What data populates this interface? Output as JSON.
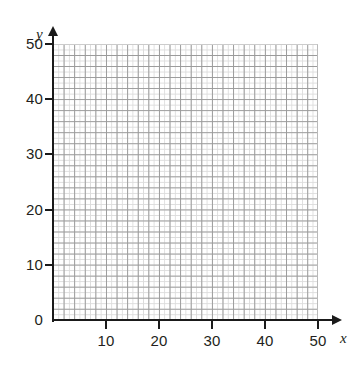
{
  "figure": {
    "kind": "blank-coordinate-grid",
    "background_color": "#ffffff"
  },
  "axes": {
    "x": {
      "name": "x",
      "min": 0,
      "max": 50,
      "labeled_ticks": [
        "10",
        "20",
        "30",
        "40",
        "50"
      ],
      "origin_label": "0",
      "arrow": true
    },
    "y": {
      "name": "y",
      "min": 0,
      "max": 50,
      "labeled_ticks": [
        "0",
        "10",
        "20",
        "30",
        "40",
        "50"
      ],
      "arrow": true
    }
  },
  "grid": {
    "minor_step": 1,
    "major_step": 2,
    "minor_color": "#dcdcdc",
    "major_color": "#9a9a9a",
    "axis_color": "#1a1a1a"
  },
  "chart_data": {
    "type": "scatter",
    "title": "",
    "xlabel": "x",
    "ylabel": "y",
    "xlim": [
      0,
      50
    ],
    "ylim": [
      0,
      50
    ],
    "xticks": [
      0,
      10,
      20,
      30,
      40,
      50
    ],
    "yticks": [
      0,
      10,
      20,
      30,
      40,
      50
    ],
    "xtick_labels": [
      "0",
      "10",
      "20",
      "30",
      "40",
      "50"
    ],
    "ytick_labels": [
      "0",
      "10",
      "20",
      "30",
      "40",
      "50"
    ],
    "grid": true,
    "grid_minor_step": 1,
    "grid_major_step": 2,
    "legend": null,
    "series": [],
    "annotations": [],
    "note": "Empty grid — no data plotted"
  }
}
